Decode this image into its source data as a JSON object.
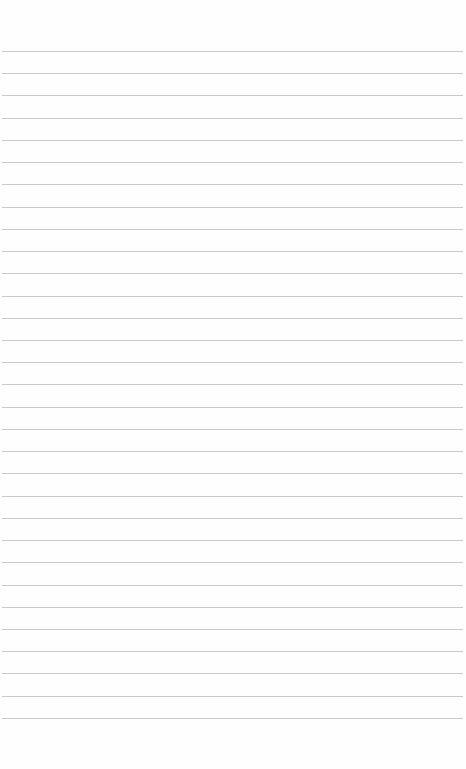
{
  "page": {
    "type": "lined-paper",
    "background_color": "#fefefe",
    "line_color": "#c9c9c9",
    "line_count": 31,
    "first_line_y": 51,
    "line_spacing": 22.23,
    "line_left": 2,
    "line_width": 461
  }
}
